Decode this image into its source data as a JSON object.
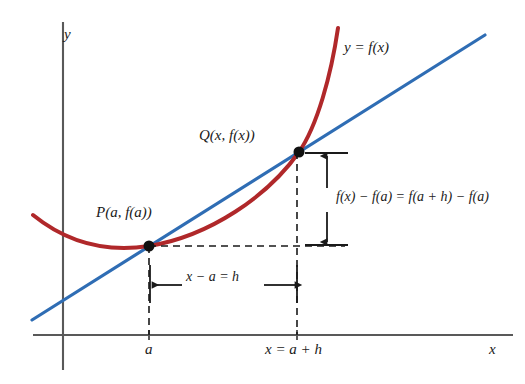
{
  "figure": {
    "background_color": "#ffffff"
  },
  "colors": {
    "curve": "#b0282a",
    "secant_line": "#2f6db4",
    "axis": "#595959",
    "dashed": "#1a1a1a",
    "arrow": "#1a1a1a",
    "point": "#111111",
    "text": "#1a1a1a"
  },
  "axes": {
    "y_label": "y",
    "x_label": "x",
    "origin": {
      "x": 63,
      "y": 335
    },
    "x_axis": {
      "x1": 33,
      "x2": 513,
      "y": 335
    },
    "y_axis": {
      "x": 63,
      "y1": 22,
      "y2": 370
    },
    "ticks": [
      {
        "name": "tick-a",
        "label": "a",
        "x": 149
      },
      {
        "name": "tick-x",
        "label": "x = a + h",
        "x": 297
      }
    ]
  },
  "curve": {
    "label": "y = f(x)",
    "path": "M 33 215 C 70 245, 110 252, 149 246 C 210 236, 268 196, 299 152 C 317 126, 331 76, 338 28",
    "stroke_width": 4
  },
  "secant": {
    "name": "secant-line",
    "x1": 32,
    "y1": 320,
    "x2": 485,
    "y2": 35,
    "stroke_width": 3.2
  },
  "points": [
    {
      "name": "point-p",
      "label": "P(a, f(a))",
      "x": 149,
      "y": 246,
      "radius": 5.5
    },
    {
      "name": "point-q",
      "label": "Q(x, f(x))",
      "x": 299,
      "y": 152,
      "radius": 5.5
    }
  ],
  "annotations": {
    "rise": {
      "label": "f(x) − f(a) = f(a + h) − f(a)",
      "arrow_x": 327,
      "arrow_y_top": 153,
      "arrow_y_bottom": 245
    },
    "run": {
      "label": "x − a = h",
      "arrow_y": 285,
      "arrow_x_left": 150,
      "arrow_x_right": 297
    }
  },
  "dashed_guides": [
    {
      "name": "dashed-horizontal-p",
      "x1": 149,
      "y1": 246,
      "x2": 345,
      "y2": 246
    },
    {
      "name": "dashed-vertical-a",
      "x1": 149,
      "y1": 246,
      "x2": 149,
      "y2": 335
    },
    {
      "name": "dashed-vertical-x",
      "x1": 297,
      "y1": 152,
      "x2": 297,
      "y2": 335
    }
  ]
}
